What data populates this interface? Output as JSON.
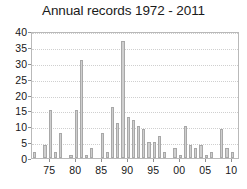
{
  "chart_data": {
    "type": "bar",
    "title": "Annual records 1972 - 2011",
    "xlabel": "",
    "ylabel": "",
    "ylim": [
      0,
      40
    ],
    "yticks": [
      0,
      5,
      10,
      15,
      20,
      25,
      30,
      35,
      40
    ],
    "ytick_labels": [
      "0",
      "5",
      "10",
      "15",
      "20",
      "25",
      "30",
      "35",
      "40"
    ],
    "grid": true,
    "grid_axis": "y",
    "legend": false,
    "bar_color": "#cfcfcf",
    "bar_edge_color": "#a8a8a8",
    "categories": [
      "1972",
      "1973",
      "1974",
      "1975",
      "1976",
      "1977",
      "1978",
      "1979",
      "1980",
      "1981",
      "1982",
      "1983",
      "1984",
      "1985",
      "1986",
      "1987",
      "1988",
      "1989",
      "1990",
      "1991",
      "1992",
      "1993",
      "1994",
      "1995",
      "1996",
      "1997",
      "1998",
      "1999",
      "2000",
      "2001",
      "2002",
      "2003",
      "2004",
      "2005",
      "2006",
      "2007",
      "2008",
      "2009",
      "2010",
      "2011"
    ],
    "xtick_labels": [
      "75",
      "80",
      "85",
      "90",
      "95",
      "00",
      "05",
      "10"
    ],
    "xtick_categories": [
      "1975",
      "1980",
      "1985",
      "1990",
      "1995",
      "2000",
      "2005",
      "2010"
    ],
    "values": [
      2,
      0,
      4,
      15,
      2,
      8,
      0,
      1,
      15,
      31,
      1,
      3,
      0,
      8,
      2,
      16,
      11,
      37,
      13,
      12,
      10,
      9,
      5,
      5,
      7,
      2,
      0,
      3,
      1,
      10,
      4,
      3,
      4,
      1,
      2,
      0,
      9,
      3,
      2,
      0
    ]
  }
}
